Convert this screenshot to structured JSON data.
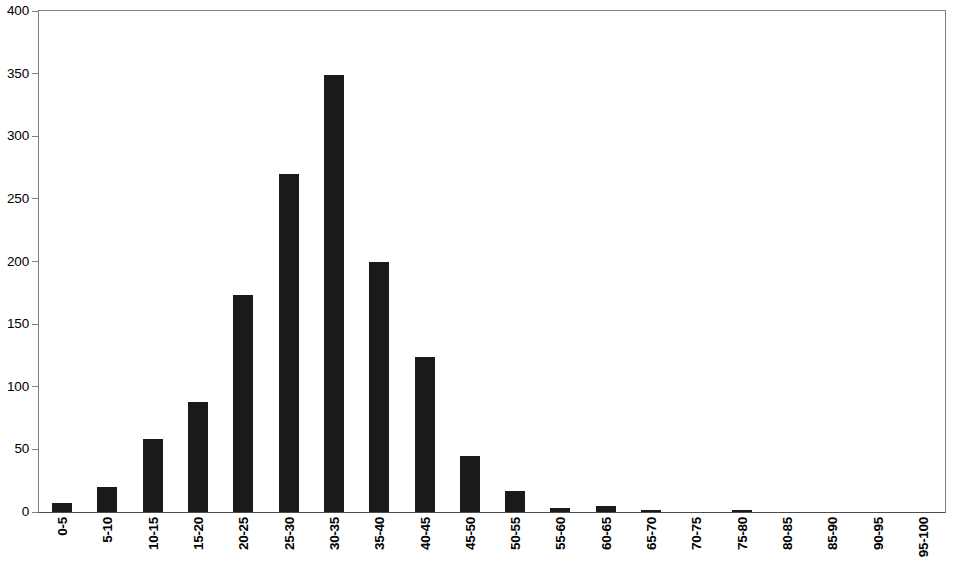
{
  "chart_data": {
    "type": "bar",
    "title": "",
    "subtitle": "",
    "xlabel": "",
    "ylabel": "",
    "grid": false,
    "legend": false,
    "ylim": [
      0,
      400
    ],
    "yticks": [
      0,
      50,
      100,
      150,
      200,
      250,
      300,
      350,
      400
    ],
    "ytick_labels": [
      "0",
      "50",
      "100",
      "150",
      "200",
      "250",
      "300",
      "350",
      "400"
    ],
    "categories": [
      "0-5",
      "5-10",
      "10-15",
      "15-20",
      "20-25",
      "25-30",
      "30-35",
      "35-40",
      "40-45",
      "45-50",
      "50-55",
      "55-60",
      "60-65",
      "65-70",
      "70-75",
      "75-80",
      "80-85",
      "85-90",
      "90-95",
      "95-100"
    ],
    "values": [
      7,
      20,
      58,
      88,
      173,
      270,
      349,
      200,
      124,
      45,
      17,
      3,
      5,
      1,
      0,
      1,
      0,
      0,
      0,
      0
    ],
    "bar_color": "#1a1a1a",
    "axis_color": "#808080",
    "background_color": "#ffffff"
  }
}
